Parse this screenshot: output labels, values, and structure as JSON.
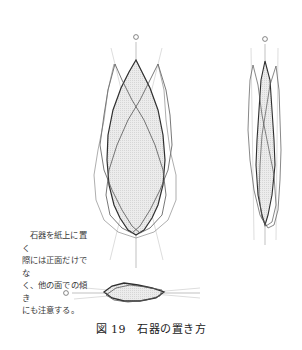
{
  "figure": {
    "number_label": "図 19",
    "title": "石器の置き方",
    "caption": "図 19　石器の置き方"
  },
  "annotation": {
    "lines": [
      "石器を紙上に置く",
      "際には正面だけでな",
      "く、他の面での傾き",
      "にも注意する。"
    ]
  },
  "views": [
    {
      "name": "front-view",
      "marker": "circle"
    },
    {
      "name": "side-view",
      "marker": "circle"
    },
    {
      "name": "bottom-view",
      "marker": "circle"
    }
  ],
  "colors": {
    "outline_dark": "#333333",
    "outline_light": "#8a8a8a",
    "fill": "#e4e4e4",
    "guide": "#b0b0b0"
  }
}
